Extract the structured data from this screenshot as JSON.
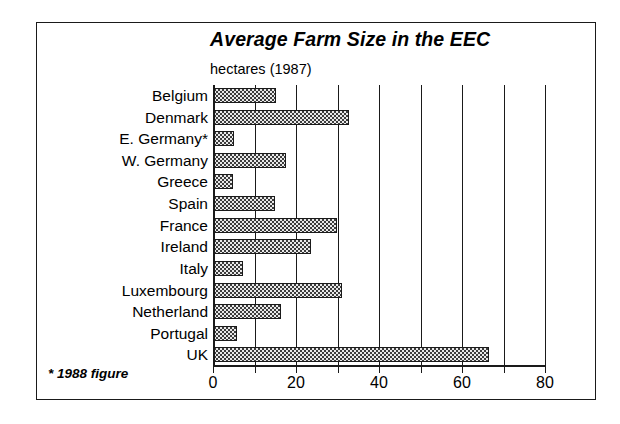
{
  "chart_data": {
    "type": "bar",
    "orientation": "horizontal",
    "title": "Average Farm Size in the EEC",
    "subtitle": "hectares (1987)",
    "footnote": "* 1988 figure",
    "xlabel": "",
    "ylabel": "",
    "xlim": [
      0,
      80
    ],
    "xticks": [
      0,
      20,
      40,
      60,
      80
    ],
    "xticklabels": [
      "0",
      "20",
      "40",
      "60",
      "80"
    ],
    "gridlines": [
      10,
      20,
      30,
      40,
      50,
      60,
      70,
      80
    ],
    "grid": true,
    "legend": "none",
    "categories": [
      "Belgium",
      "Denmark",
      "E. Germany*",
      "W. Germany",
      "Greece",
      "Spain",
      "France",
      "Ireland",
      "Italy",
      "Luxembourg",
      "Netherland",
      "Portugal",
      "UK"
    ],
    "values": [
      15.2,
      32.8,
      5.0,
      17.7,
      4.7,
      15.0,
      29.8,
      23.5,
      7.3,
      31.2,
      16.5,
      5.7,
      66.4
    ],
    "bar_fill": "#e9e9e9",
    "bar_edge": "#1a1a1a",
    "frame_color": "#1a1a1a",
    "background": "#ffffff"
  }
}
